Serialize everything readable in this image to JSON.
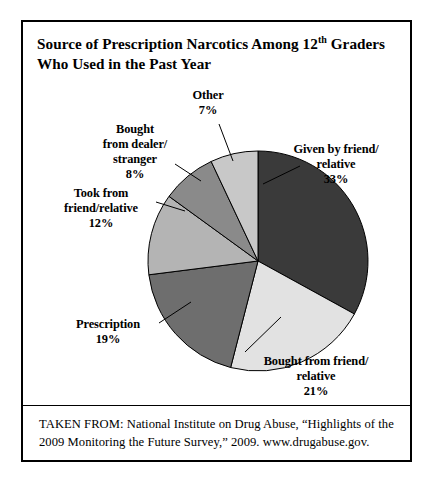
{
  "figure": {
    "title_line1_pre": "Source of Prescription Narcotics Among 12",
    "title_sup": "th",
    "title_line1_post": " Graders",
    "title_line2": "Who Used in the Past Year",
    "source": "TAKEN FROM: National Institute on Drug Abuse, “Highlights of the 2009 Monitoring the Future Survey,” 2009. www.drugabuse.gov."
  },
  "labels": {
    "other": {
      "name": "Other",
      "pct": "7%"
    },
    "dealer": {
      "name": "Bought\nfrom dealer/\nstranger",
      "pct": "8%"
    },
    "took": {
      "name": "Took from\nfriend/relative",
      "pct": "12%"
    },
    "prescription": {
      "name": "Prescription",
      "pct": "19%"
    },
    "bought_friend": {
      "name": "Bought from friend/\nrelative",
      "pct": "21%"
    },
    "given": {
      "name": "Given by friend/\nrelative",
      "pct": "33%"
    }
  },
  "chart_data": {
    "type": "pie",
    "title": "Source of Prescription Narcotics Among 12th Graders Who Used in the Past Year",
    "xlabel": "",
    "ylabel": "",
    "legend_position": "callout-labels",
    "grid": false,
    "units": "percent",
    "start_angle_deg": 0,
    "direction": "clockwise",
    "categories": [
      "Given by friend/relative",
      "Bought from friend/relative",
      "Prescription",
      "Took from friend/relative",
      "Bought from dealer/stranger",
      "Other"
    ],
    "values": [
      33,
      21,
      19,
      12,
      8,
      7
    ],
    "value_labels": [
      "33%",
      "21%",
      "19%",
      "12%",
      "8%",
      "7%"
    ],
    "colors": [
      "#3a3a3a",
      "#e2e2e2",
      "#6e6e6e",
      "#b4b4b4",
      "#8a8a8a",
      "#c8c8c8"
    ],
    "total": 100,
    "source": "National Institute on Drug Abuse, “Highlights of the 2009 Monitoring the Future Survey,” 2009. www.drugabuse.gov."
  },
  "geometry": {
    "cx": 235,
    "cy": 181,
    "r": 110
  }
}
